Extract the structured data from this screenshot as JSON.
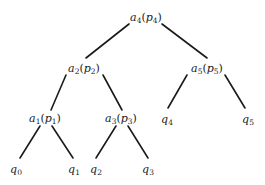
{
  "diagram": {
    "type": "binary-tree",
    "edge_color": "#1a1a1a",
    "nodes": [
      {
        "id": "a4",
        "base": "a",
        "sub": "4",
        "paren_base": "p",
        "paren_sub": "4",
        "x": 146,
        "y": 17,
        "kind": "internal"
      },
      {
        "id": "a2",
        "base": "a",
        "sub": "2",
        "paren_base": "p",
        "paren_sub": "2",
        "x": 84,
        "y": 68,
        "kind": "internal"
      },
      {
        "id": "a5",
        "base": "a",
        "sub": "5",
        "paren_base": "p",
        "paren_sub": "5",
        "x": 207,
        "y": 68,
        "kind": "internal"
      },
      {
        "id": "a1",
        "base": "a",
        "sub": "1",
        "paren_base": "p",
        "paren_sub": "1",
        "x": 45,
        "y": 118,
        "kind": "internal"
      },
      {
        "id": "a3",
        "base": "a",
        "sub": "3",
        "paren_base": "p",
        "paren_sub": "3",
        "x": 121,
        "y": 118,
        "kind": "internal"
      },
      {
        "id": "q4",
        "base": "q",
        "sub": "4",
        "x": 167,
        "y": 119,
        "kind": "leaf"
      },
      {
        "id": "q5",
        "base": "q",
        "sub": "5",
        "x": 248,
        "y": 119,
        "kind": "leaf"
      },
      {
        "id": "q0",
        "base": "q",
        "sub": "0",
        "x": 16,
        "y": 169,
        "kind": "leaf"
      },
      {
        "id": "q1",
        "base": "q",
        "sub": "1",
        "x": 74,
        "y": 169,
        "kind": "leaf"
      },
      {
        "id": "q2",
        "base": "q",
        "sub": "2",
        "x": 96,
        "y": 169,
        "kind": "leaf"
      },
      {
        "id": "q3",
        "base": "q",
        "sub": "3",
        "x": 148,
        "y": 169,
        "kind": "leaf"
      }
    ],
    "edges": [
      {
        "from": "a4",
        "to": "a2",
        "x1": 129,
        "y1": 24,
        "x2": 86,
        "y2": 58
      },
      {
        "from": "a4",
        "to": "a5",
        "x1": 162,
        "y1": 24,
        "x2": 207,
        "y2": 58
      },
      {
        "from": "a2",
        "to": "a1",
        "x1": 66,
        "y1": 75,
        "x2": 51,
        "y2": 110
      },
      {
        "from": "a2",
        "to": "a3",
        "x1": 103,
        "y1": 75,
        "x2": 122,
        "y2": 110
      },
      {
        "from": "a5",
        "to": "q4",
        "x1": 187,
        "y1": 75,
        "x2": 168,
        "y2": 108
      },
      {
        "from": "a5",
        "to": "q5",
        "x1": 225,
        "y1": 75,
        "x2": 245,
        "y2": 108
      },
      {
        "from": "a1",
        "to": "q0",
        "x1": 40,
        "y1": 126,
        "x2": 20,
        "y2": 158
      },
      {
        "from": "a1",
        "to": "q1",
        "x1": 52,
        "y1": 126,
        "x2": 73,
        "y2": 158
      },
      {
        "from": "a3",
        "to": "q2",
        "x1": 116,
        "y1": 126,
        "x2": 96,
        "y2": 158
      },
      {
        "from": "a3",
        "to": "q3",
        "x1": 128,
        "y1": 126,
        "x2": 148,
        "y2": 158
      }
    ]
  }
}
